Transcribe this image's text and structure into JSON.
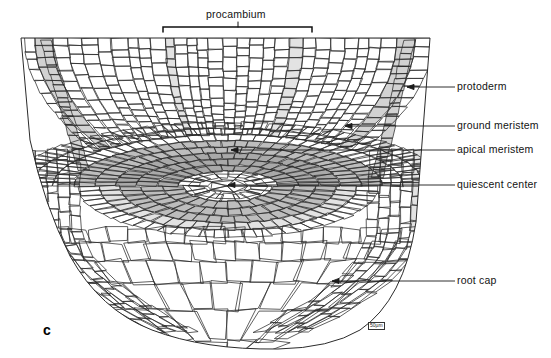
{
  "figure": {
    "letter": "c",
    "scale_marker": "50µm",
    "bracket_label": "procambium"
  },
  "labels": [
    {
      "id": "protoderm",
      "text": "protoderm",
      "x": 457,
      "y": 84,
      "leader": {
        "x1": 455,
        "y1": 87,
        "x2": 407,
        "y2": 87
      }
    },
    {
      "id": "ground-meristem",
      "text": "ground meristem",
      "x": 457,
      "y": 123,
      "leader": {
        "x1": 455,
        "y1": 126,
        "x2": 345,
        "y2": 126
      }
    },
    {
      "id": "apical-meristem",
      "text": "apical meristem",
      "x": 457,
      "y": 147,
      "leader": {
        "x1": 455,
        "y1": 150,
        "x2": 231,
        "y2": 150
      }
    },
    {
      "id": "quiescent-center",
      "text": "quiescent center",
      "x": 457,
      "y": 182,
      "leader": {
        "x1": 455,
        "y1": 185,
        "x2": 228,
        "y2": 185
      }
    },
    {
      "id": "root-cap",
      "text": "root cap",
      "x": 457,
      "y": 278,
      "leader": {
        "x1": 455,
        "y1": 281,
        "x2": 332,
        "y2": 281
      }
    }
  ],
  "bracket": {
    "label": "procambium",
    "label_x": 206,
    "label_y": 10,
    "x_left": 163,
    "x_right": 312,
    "y": 27,
    "tick_x": 238,
    "tick_top": 22
  },
  "colors": {
    "cell_stroke": "#2b2b2b",
    "background": "#ffffff",
    "shade_light": "#e3e3e3",
    "shade_mid": "#d2d2d2",
    "shade_dark": "#bdbdbd",
    "shade_darker": "#a9a9a9",
    "label_text": "#131313",
    "leader_line": "#1a1a1a"
  },
  "regions": [
    {
      "name": "protoderm",
      "shading": "light",
      "description": "single outermost cell layer along flanks"
    },
    {
      "name": "ground meristem",
      "shading": "none",
      "description": "cortical cell files inside protoderm"
    },
    {
      "name": "procambium",
      "shading": "light",
      "description": "central vertical cell files in the stele"
    },
    {
      "name": "apical meristem",
      "shading": "dark",
      "description": "dome of small dense cells around the quiescent center"
    },
    {
      "name": "quiescent center",
      "shading": "none",
      "description": "central lens of pale cells"
    },
    {
      "name": "root cap",
      "shading": "none",
      "description": "large polygonal cells below the apex"
    }
  ]
}
